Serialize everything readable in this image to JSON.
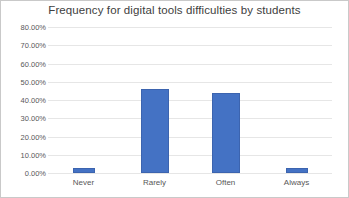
{
  "chart_data": {
    "type": "bar",
    "title": "Frequency for digital tools difficulties by students",
    "xlabel": "",
    "ylabel": "",
    "categories": [
      "Never",
      "Rarely",
      "Often",
      "Always"
    ],
    "values": [
      3,
      46,
      44,
      3
    ],
    "value_labels": [
      "3.00%",
      "46.00%",
      "44.00%",
      "3.00%"
    ],
    "ylim": [
      0,
      80
    ],
    "ytick_values": [
      0,
      10,
      20,
      30,
      40,
      50,
      60,
      70,
      80
    ],
    "ytick_labels": [
      "0.00%",
      "10.00%",
      "20.00%",
      "30.00%",
      "40.00%",
      "50.00%",
      "60.00%",
      "70.00%",
      "80.00%"
    ],
    "grid": true,
    "legend": false,
    "legend_position": "none",
    "series": [
      {
        "name": "Frequency",
        "values": [
          3,
          46,
          44,
          3
        ]
      }
    ],
    "colors": {
      "bar_fill": "#4472C4",
      "bar_border": "#3C64AF",
      "gridline": "#E6E6E6",
      "text": "#585858",
      "title_text": "#404040",
      "plot_background": "#FFFFFF",
      "frame_border": "#C9C9C9"
    }
  }
}
